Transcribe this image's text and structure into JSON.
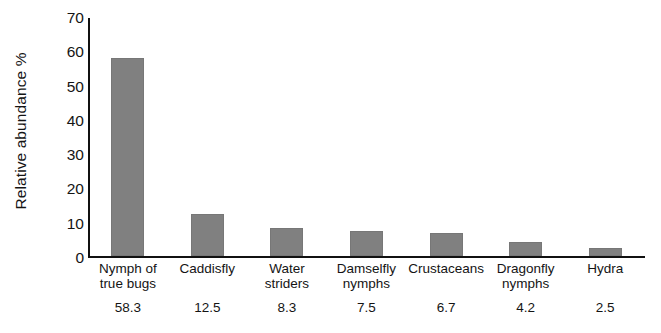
{
  "chart_data": {
    "type": "bar",
    "title": "",
    "xlabel": "",
    "ylabel": "Relative abundance %",
    "ylim": [
      0,
      70
    ],
    "ytick_step": 10,
    "yticks": [
      0,
      10,
      20,
      30,
      40,
      50,
      60,
      70
    ],
    "grid": false,
    "legend": false,
    "bar_color": "#808080",
    "axis_color": "#111111",
    "categories": [
      "Nymph of\ntrue bugs",
      "Caddisfly",
      "Water\nstriders",
      "Damselfly\nnymphs",
      "Crustaceans",
      "Dragonfly\nnymphs",
      "Hydra"
    ],
    "values": [
      58.3,
      12.5,
      8.3,
      7.5,
      6.7,
      4.2,
      2.5
    ],
    "value_labels": [
      "58.3",
      "12.5",
      "8.3",
      "7.5",
      "6.7",
      "4.2",
      "2.5"
    ]
  }
}
